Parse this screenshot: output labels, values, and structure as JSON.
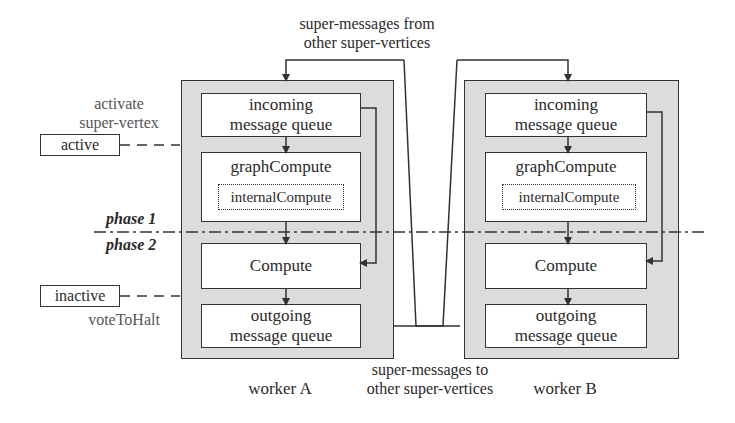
{
  "top_label": {
    "line1": "super-messages from",
    "line2": "other super-vertices"
  },
  "bottom_label": {
    "line1": "super-messages to",
    "line2": "other super-vertices"
  },
  "left": {
    "activate_label": {
      "line1": "activate",
      "line2": "super-vertex"
    },
    "active_state": "active",
    "inactive_state": "inactive",
    "halt_label": "voteToHalt"
  },
  "phases": {
    "phase1": "phase 1",
    "phase2": "phase 2"
  },
  "workers": [
    {
      "name": "worker A",
      "incoming": {
        "line1": "incoming",
        "line2": "message queue"
      },
      "graph_compute": "graphCompute",
      "internal_compute": "internalCompute",
      "compute": "Compute",
      "outgoing": {
        "line1": "outgoing",
        "line2": "message queue"
      }
    },
    {
      "name": "worker B",
      "incoming": {
        "line1": "incoming",
        "line2": "message queue"
      },
      "graph_compute": "graphCompute",
      "internal_compute": "internalCompute",
      "compute": "Compute",
      "outgoing": {
        "line1": "outgoing",
        "line2": "message queue"
      }
    }
  ],
  "colors": {
    "worker_fill": "#dcdcdc",
    "line": "#333333",
    "label_gray": "#555555"
  }
}
